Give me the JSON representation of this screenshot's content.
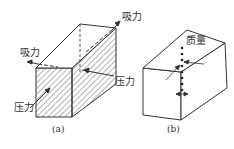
{
  "figure": {
    "panels": [
      {
        "id": "a",
        "caption": "(a)",
        "labels": {
          "suction_top_right": "吸力",
          "suction_left": "吸力",
          "pressure_right": "压力",
          "pressure_bottom_left": "压力"
        }
      },
      {
        "id": "b",
        "caption": "(b)",
        "labels": {
          "mass": "质量"
        }
      }
    ]
  },
  "colors": {
    "line": "#333333",
    "background": "#ffffff"
  }
}
